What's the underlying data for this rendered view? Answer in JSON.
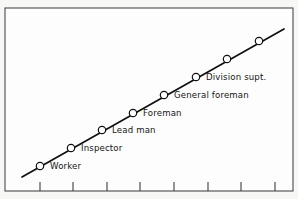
{
  "figure": {
    "background_color": "#fdfdfd",
    "margin_color": "#f7f7f6",
    "frame_color": "#4a4a4a",
    "line_color": "#101010",
    "marker_fill": "#ffffff",
    "marker_stroke": "#101010",
    "axis_color": "#3d3d3d"
  },
  "chart_data": {
    "type": "line",
    "title": "",
    "subtitle": "",
    "xlabel": "",
    "ylabel": "",
    "grid": false,
    "legend_position": "none",
    "xlim": [
      0,
      9
    ],
    "ylim": [
      0,
      9
    ],
    "x_tick_count": 8,
    "x_tick_labels": [
      "",
      "",
      "",
      "",
      "",
      "",
      "",
      ""
    ],
    "y_tick_labels": [],
    "categories": [
      "Worker",
      "Inspector",
      "Lead man",
      "Foreman",
      "General foreman",
      "Division supt.",
      "",
      ""
    ],
    "series": [
      {
        "name": "Job level progression",
        "x": [
          1,
          2,
          3,
          4,
          5,
          6,
          7,
          8
        ],
        "values": [
          1,
          2,
          3,
          4,
          5,
          6,
          7,
          8
        ]
      }
    ],
    "annotations": [
      {
        "label": "Worker",
        "x": 1,
        "y": 1
      },
      {
        "label": "Inspector",
        "x": 2,
        "y": 2
      },
      {
        "label": "Lead man",
        "x": 3,
        "y": 3
      },
      {
        "label": "Foreman",
        "x": 4,
        "y": 4
      },
      {
        "label": "General foreman",
        "x": 5,
        "y": 5
      },
      {
        "label": "Division supt.",
        "x": 6,
        "y": 6
      }
    ]
  },
  "points": [
    {
      "name": "point-worker",
      "cx": 40,
      "cy": 166,
      "label": "Worker",
      "lx": 50,
      "ly": 169
    },
    {
      "name": "point-inspector",
      "cx": 71,
      "cy": 148,
      "label": "Inspector",
      "lx": 81,
      "ly": 151
    },
    {
      "name": "point-lead-man",
      "cx": 102,
      "cy": 130,
      "label": "Lead man",
      "lx": 112,
      "ly": 133
    },
    {
      "name": "point-foreman",
      "cx": 133,
      "cy": 113,
      "label": "Foreman",
      "lx": 143,
      "ly": 116
    },
    {
      "name": "point-general-foreman",
      "cx": 164,
      "cy": 95,
      "label": "General foreman",
      "lx": 174,
      "ly": 98
    },
    {
      "name": "point-division-supt",
      "cx": 196,
      "cy": 77,
      "label": "Division supt.",
      "lx": 206,
      "ly": 80
    },
    {
      "name": "point-unlabeled-7",
      "cx": 227,
      "cy": 59,
      "label": "",
      "lx": 0,
      "ly": 0
    },
    {
      "name": "point-unlabeled-8",
      "cx": 259,
      "cy": 41,
      "label": "",
      "lx": 0,
      "ly": 0
    }
  ],
  "trend_line": {
    "x1": 22,
    "y1": 177,
    "x2": 284,
    "y2": 29
  },
  "x_ticks": [
    40,
    73,
    107,
    140,
    174,
    208,
    241,
    275
  ],
  "frame": {
    "x": 5,
    "y": 8,
    "width": 288,
    "height": 183
  }
}
